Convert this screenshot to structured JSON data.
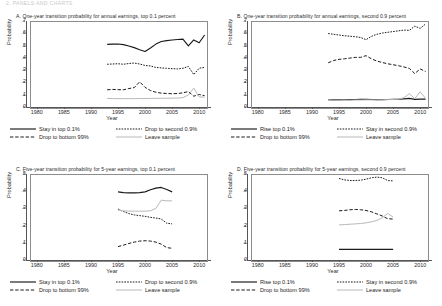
{
  "page": {
    "running_header": "2. PANELS AND CHARTS"
  },
  "axis": {
    "ylabel": "Probability",
    "xlabel": "Year",
    "xticks": [
      "1980",
      "1985",
      "1990",
      "1995",
      "2000",
      "2005",
      "2010"
    ],
    "xlim": [
      1978,
      2012
    ],
    "yticks_7": [
      "0",
      ".1",
      ".2",
      ".3",
      ".4",
      ".5",
      ".6",
      ".7"
    ],
    "yticks_5": [
      "0",
      ".1",
      ".2",
      ".3",
      ".4",
      ".5"
    ]
  },
  "colors": {
    "line_dark": "#1a1a1a",
    "line_light": "#b8b8b8",
    "frame": "#8c8c8c",
    "axis": "#555555"
  },
  "legends": {
    "top01": [
      {
        "label": "Stay in top 0.1%",
        "style": "solid"
      },
      {
        "label": "Drop to second 0.9%",
        "style": "dotted"
      },
      {
        "label": "Drop to bottom 99%",
        "style": "dashed"
      },
      {
        "label": "Leave sample",
        "style": "light-solid"
      }
    ],
    "second09": [
      {
        "label": "Rise top 0.1%",
        "style": "solid"
      },
      {
        "label": "Stay in second 0.9%",
        "style": "dotted"
      },
      {
        "label": "Drop to bottom 99%",
        "style": "dashed"
      },
      {
        "label": "Leave sample",
        "style": "light-solid"
      }
    ]
  },
  "chart_data": [
    {
      "id": "A",
      "type": "line",
      "title": "A. One-year transition probability for annual earnings, top 0.1 percent",
      "xlabel": "Year",
      "ylabel": "Probability",
      "xlim": [
        1978,
        2012
      ],
      "ylim": [
        0,
        0.7
      ],
      "grid": false,
      "legend": "below",
      "legend_set": "top01",
      "x": [
        1993,
        1994,
        1995,
        1996,
        1997,
        1998,
        1999,
        2000,
        2001,
        2002,
        2003,
        2004,
        2005,
        2006,
        2007,
        2008,
        2009,
        2010,
        2011
      ],
      "series": [
        {
          "name": "Stay in top 0.1%",
          "style": "solid",
          "values": [
            0.51,
            0.512,
            0.513,
            0.508,
            0.497,
            0.483,
            0.466,
            0.452,
            0.48,
            0.512,
            0.533,
            0.54,
            0.545,
            0.549,
            0.552,
            0.497,
            0.546,
            0.523,
            0.586
          ]
        },
        {
          "name": "Drop to second 0.9%",
          "style": "dotted",
          "values": [
            0.348,
            0.35,
            0.352,
            0.348,
            0.354,
            0.358,
            0.35,
            0.338,
            0.334,
            0.322,
            0.318,
            0.315,
            0.312,
            0.31,
            0.315,
            0.33,
            0.264,
            0.316,
            0.322
          ]
        },
        {
          "name": "Drop to bottom 99%",
          "style": "dashed",
          "values": [
            0.14,
            0.143,
            0.141,
            0.14,
            0.15,
            0.158,
            0.205,
            0.16,
            0.134,
            0.12,
            0.113,
            0.11,
            0.108,
            0.11,
            0.115,
            0.126,
            0.088,
            0.102,
            0.092
          ]
        },
        {
          "name": "Leave sample",
          "style": "light-solid",
          "values": [
            0.07,
            0.069,
            0.068,
            0.068,
            0.068,
            0.068,
            0.069,
            0.069,
            0.07,
            0.07,
            0.071,
            0.071,
            0.072,
            0.073,
            0.076,
            0.098,
            0.154,
            0.082,
            0.08
          ]
        }
      ]
    },
    {
      "id": "B",
      "type": "line",
      "title": "B. One-year transition probability for annual earnings, second 0.9 percent",
      "xlabel": "Year",
      "ylabel": "Probability",
      "xlim": [
        1978,
        2012
      ],
      "ylim": [
        0,
        0.7
      ],
      "grid": false,
      "legend": "below",
      "legend_set": "second09",
      "x": [
        1993,
        1994,
        1995,
        1996,
        1997,
        1998,
        1999,
        2000,
        2001,
        2002,
        2003,
        2004,
        2005,
        2006,
        2007,
        2008,
        2009,
        2010,
        2011
      ],
      "series": [
        {
          "name": "Rise top 0.1%",
          "style": "solid",
          "values": [
            0.057,
            0.058,
            0.058,
            0.059,
            0.06,
            0.061,
            0.062,
            0.062,
            0.061,
            0.06,
            0.06,
            0.061,
            0.062,
            0.063,
            0.066,
            0.07,
            0.062,
            0.064,
            0.064
          ]
        },
        {
          "name": "Stay in second 0.9%",
          "style": "dotted",
          "values": [
            0.598,
            0.592,
            0.586,
            0.58,
            0.576,
            0.572,
            0.566,
            0.548,
            0.575,
            0.592,
            0.602,
            0.608,
            0.614,
            0.62,
            0.626,
            0.624,
            0.658,
            0.64,
            0.676
          ]
        },
        {
          "name": "Drop to bottom 99%",
          "style": "dashed",
          "values": [
            0.36,
            0.378,
            0.388,
            0.392,
            0.398,
            0.404,
            0.404,
            0.418,
            0.392,
            0.374,
            0.362,
            0.352,
            0.344,
            0.336,
            0.326,
            0.314,
            0.272,
            0.31,
            0.288
          ]
        },
        {
          "name": "Leave sample",
          "style": "light-solid",
          "values": [
            0.054,
            0.055,
            0.055,
            0.056,
            0.056,
            0.057,
            0.057,
            0.058,
            0.058,
            0.058,
            0.059,
            0.06,
            0.061,
            0.064,
            0.076,
            0.108,
            0.068,
            0.124,
            0.07
          ]
        }
      ]
    },
    {
      "id": "C",
      "type": "line",
      "title": "C. Five-year transition probability for 5-year earnings, top 0.1 percent",
      "xlabel": "Year",
      "ylabel": "Probability",
      "xlim": [
        1978,
        2012
      ],
      "ylim": [
        0,
        0.5
      ],
      "grid": false,
      "legend": "below",
      "legend_set": "top01",
      "x": [
        1995,
        1996,
        1997,
        1998,
        1999,
        2000,
        2001,
        2002,
        2003,
        2004,
        2005
      ],
      "series": [
        {
          "name": "Stay in top 0.1%",
          "style": "solid",
          "values": [
            0.396,
            0.392,
            0.39,
            0.39,
            0.392,
            0.396,
            0.408,
            0.418,
            0.422,
            0.41,
            0.396
          ]
        },
        {
          "name": "Drop to second 0.9%",
          "style": "dotted",
          "values": [
            0.296,
            0.282,
            0.27,
            0.262,
            0.258,
            0.254,
            0.248,
            0.244,
            0.238,
            0.214,
            0.21
          ]
        },
        {
          "name": "Drop to bottom 99%",
          "style": "dashed",
          "values": [
            0.078,
            0.086,
            0.096,
            0.104,
            0.11,
            0.112,
            0.11,
            0.104,
            0.092,
            0.072,
            0.068
          ]
        },
        {
          "name": "Leave sample",
          "style": "light-solid",
          "values": [
            0.29,
            0.286,
            0.284,
            0.284,
            0.284,
            0.284,
            0.286,
            0.3,
            0.348,
            0.344,
            0.344
          ]
        }
      ]
    },
    {
      "id": "D",
      "type": "line",
      "title": "D. Five-year transition probability for 5-year earnings, second 0.9 percent",
      "xlabel": "Year",
      "ylabel": "Probability",
      "xlim": [
        1978,
        2012
      ],
      "ylim": [
        0,
        0.5
      ],
      "grid": false,
      "legend": "below",
      "legend_set": "second09",
      "x": [
        1995,
        1996,
        1997,
        1998,
        1999,
        2000,
        2001,
        2002,
        2003,
        2004,
        2005
      ],
      "series": [
        {
          "name": "Rise top 0.1%",
          "style": "solid",
          "values": [
            0.062,
            0.062,
            0.062,
            0.062,
            0.062,
            0.062,
            0.062,
            0.062,
            0.062,
            0.062,
            0.062
          ]
        },
        {
          "name": "Stay in second 0.9%",
          "style": "dotted",
          "values": [
            0.474,
            0.466,
            0.462,
            0.462,
            0.464,
            0.47,
            0.478,
            0.482,
            0.478,
            0.462,
            0.46
          ]
        },
        {
          "name": "Drop to bottom 99%",
          "style": "dashed",
          "values": [
            0.286,
            0.288,
            0.292,
            0.294,
            0.292,
            0.288,
            0.28,
            0.268,
            0.256,
            0.24,
            0.238
          ]
        },
        {
          "name": "Leave sample",
          "style": "light-solid",
          "values": [
            0.204,
            0.206,
            0.208,
            0.21,
            0.212,
            0.216,
            0.222,
            0.23,
            0.246,
            0.27,
            0.25
          ]
        }
      ]
    }
  ]
}
